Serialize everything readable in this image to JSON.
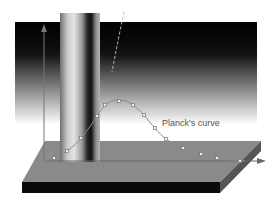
{
  "diagram": {
    "title": "Planck's curve",
    "curve_label": "Planck's curve",
    "elements": [
      "vertical-axis",
      "horizontal-axis",
      "light-beam-column",
      "gradient-backdrop",
      "slab",
      "dashed-classical-curve",
      "planck-curve"
    ]
  },
  "colors": {
    "backdrop_top": "#000000",
    "backdrop_bottom": "#ffffff",
    "slab_top": "#8a8a8a",
    "slab_front": "#0a0a0a",
    "slab_side": "#5a5a5a",
    "axis": "#707070",
    "curve": "#888888",
    "text": "#555555"
  },
  "planck_points": [
    [
      54,
      158
    ],
    [
      67,
      151
    ],
    [
      81,
      138
    ],
    [
      97,
      116
    ],
    [
      105,
      105
    ],
    [
      119,
      101
    ],
    [
      133,
      105
    ],
    [
      144,
      115
    ],
    [
      155,
      128
    ],
    [
      166,
      139
    ],
    [
      183,
      148
    ],
    [
      201,
      154
    ],
    [
      217,
      158
    ],
    [
      240,
      161
    ]
  ]
}
